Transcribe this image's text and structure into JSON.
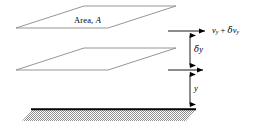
{
  "figure": {
    "type": "physics-schematic",
    "width": 257,
    "height": 129,
    "background_color": "#ffffff"
  },
  "labels": {
    "area": {
      "text_prefix": "Area,",
      "text_symbol": "A",
      "full": "Area, A",
      "x": 74,
      "y": 16
    },
    "velocity": {
      "symbol_v": "v",
      "sub_1": "y",
      "operator": "+",
      "delta": "δ",
      "symbol_v2": "v",
      "sub_2": "y",
      "full": "vᵧ + δvᵧ",
      "x": 212,
      "y": 26
    },
    "delta_y": {
      "delta": "δ",
      "symbol": "y",
      "full": "δy",
      "x": 194,
      "y": 45
    },
    "y_height": {
      "symbol": "y",
      "full": "y",
      "x": 194,
      "y": 84
    }
  },
  "geometry": {
    "plate_upper": {
      "name": "upper-fluid-layer",
      "points": "16,28 84,6 176,6 108,28",
      "stroke": "#8a8a8a",
      "fill": "#ffffff"
    },
    "plate_lower": {
      "name": "lower-fluid-layer",
      "points": "16,70 84,48 176,48 108,70",
      "stroke": "#8a8a8a",
      "fill": "#ffffff"
    },
    "ground": {
      "name": "stationary-wall",
      "points": "22,120 32,109 196,109 186,120",
      "top_line_y": 109,
      "stroke": "#000000",
      "hatch_color": "#9a9a9a"
    },
    "arrow_velocity_top": {
      "x1": 168,
      "y1": 31,
      "x2": 208,
      "y2": 31
    },
    "arrow_velocity_bottom": {
      "x1": 168,
      "y1": 70,
      "x2": 206,
      "y2": 70
    },
    "arrow_delta_y": {
      "x": 190,
      "y1": 31,
      "y2": 70
    },
    "arrow_y": {
      "x": 190,
      "y1": 70,
      "y2": 109
    }
  },
  "colors": {
    "line": "#000000",
    "plate_outline": "#8a8a8a",
    "hatch": "#9a9a9a",
    "background": "#ffffff"
  }
}
